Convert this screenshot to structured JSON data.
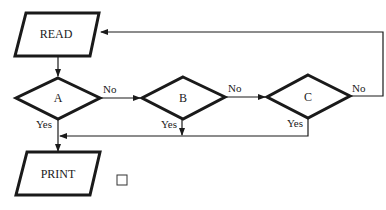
{
  "diagram": {
    "type": "flowchart",
    "nodes": [
      {
        "id": "read",
        "shape": "parallelogram",
        "label": "READ"
      },
      {
        "id": "a",
        "shape": "diamond",
        "label": "A"
      },
      {
        "id": "b",
        "shape": "diamond",
        "label": "B"
      },
      {
        "id": "c",
        "shape": "diamond",
        "label": "C"
      },
      {
        "id": "print",
        "shape": "parallelogram",
        "label": "PRINT"
      }
    ],
    "edges": [
      {
        "from": "read",
        "to": "a",
        "label": ""
      },
      {
        "from": "a",
        "to": "b",
        "label": "No"
      },
      {
        "from": "b",
        "to": "c",
        "label": "No"
      },
      {
        "from": "c",
        "to": "read",
        "label": "No"
      },
      {
        "from": "a",
        "to": "print",
        "label": "Yes"
      },
      {
        "from": "b",
        "to": "print",
        "label": "Yes"
      },
      {
        "from": "c",
        "to": "print",
        "label": "Yes"
      }
    ],
    "end_marker": "□"
  },
  "labels": {
    "read": "READ",
    "a": "A",
    "b": "B",
    "c": "C",
    "print": "PRINT",
    "a_no": "No",
    "b_no": "No",
    "c_no": "No",
    "a_yes": "Yes",
    "b_yes": "Yes",
    "c_yes": "Yes",
    "end_marker": "□"
  },
  "colors": {
    "stroke": "#1a1a1a",
    "background": "#ffffff"
  }
}
